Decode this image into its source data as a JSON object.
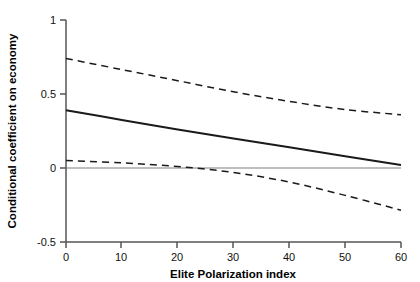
{
  "chart_data": {
    "type": "line",
    "title": "",
    "subtitle": "",
    "xlabel": "Elite Polarization index",
    "ylabel": "Conditional coefficient on economy",
    "xlim": [
      0,
      60
    ],
    "ylim": [
      -0.5,
      1
    ],
    "xticks": [
      0,
      10,
      20,
      30,
      40,
      50,
      60
    ],
    "xtick_labels": [
      "0",
      "10",
      "20",
      "30",
      "40",
      "50",
      "60"
    ],
    "yticks": [
      -0.5,
      0,
      0.5,
      1
    ],
    "ytick_labels": [
      "-0.5",
      "0",
      "0.5",
      "1"
    ],
    "grid": false,
    "legend": "none",
    "zero_reference_line": {
      "value": 0,
      "color": "#999999",
      "style": "solid"
    },
    "x": [
      0,
      10,
      20,
      30,
      40,
      50,
      60
    ],
    "series": [
      {
        "name": "Conditional coefficient (point estimate)",
        "style": "solid",
        "color": "#1a1a1a",
        "width": 2.0,
        "values": [
          0.39,
          0.325,
          0.26,
          0.2,
          0.14,
          0.08,
          0.02
        ]
      },
      {
        "name": "Upper 95% confidence bound",
        "style": "dashed",
        "color": "#1a1a1a",
        "width": 1.5,
        "values": [
          0.74,
          0.665,
          0.59,
          0.515,
          0.45,
          0.395,
          0.36
        ]
      },
      {
        "name": "Lower 95% confidence bound",
        "style": "dashed",
        "color": "#1a1a1a",
        "width": 1.5,
        "values": [
          0.05,
          0.035,
          0.01,
          -0.03,
          -0.095,
          -0.185,
          -0.285
        ]
      }
    ],
    "annotations": []
  },
  "axis": {
    "x_title": "Elite Polarization index",
    "y_title": "Conditional coefficient on economy",
    "x_labels": [
      "0",
      "10",
      "20",
      "30",
      "40",
      "50",
      "60"
    ],
    "y_labels": [
      "1",
      "0.5",
      "0",
      "-0.5"
    ]
  },
  "colors": {
    "axis": "#4d4d4d",
    "line": "#1a1a1a",
    "zero_line": "#a0a0a0",
    "background": "#ffffff",
    "text": "#000000"
  }
}
